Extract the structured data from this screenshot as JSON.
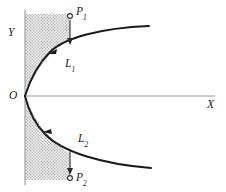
{
  "figure": {
    "kind": "geometry-diagram",
    "background_color": "#ffffff",
    "width": 226,
    "height": 192
  },
  "colors": {
    "axis": "#9a9a9a",
    "curve": "#1a1a1a",
    "drop_line": "#2a2a2a",
    "shade_fill": "#c9c9c9",
    "marker_fill": "#ffffff",
    "label_text": "#1a1a1a"
  },
  "axes": {
    "x_axis": {
      "name": "x-axis",
      "label": "X",
      "label_x": 211,
      "label_y": 105,
      "y_position": 96,
      "x_start": 25,
      "x_end": 215
    },
    "y_axis": {
      "name": "y-axis",
      "label": "Y",
      "label_x": 12,
      "label_y": 33,
      "x_position": 25,
      "y_start": 10,
      "y_end": 185
    },
    "origin": {
      "label": "O",
      "x": 25,
      "y": 96
    }
  },
  "shaded_region": {
    "name": "stippled-strip",
    "x": 25,
    "y": 14,
    "width": 45,
    "height": 166,
    "fill": "#c9c9c9",
    "pattern": "stipple",
    "note": "vertical strip to the right of the Y axis; interior of the parabola is left unshaded"
  },
  "curve": {
    "name": "parabola",
    "orientation": "opens-right",
    "vertex": {
      "x": 25,
      "y": 96
    },
    "upper_branch_end": {
      "x": 149,
      "y": 26
    },
    "lower_branch_end": {
      "x": 151,
      "y": 168
    },
    "direction_arrows": [
      {
        "x": 50,
        "y": 52,
        "points": "toward-vertex"
      },
      {
        "x": 45,
        "y": 131,
        "points": "toward-vertex"
      }
    ]
  },
  "points": [
    {
      "id": "P1",
      "label": "P",
      "subscript": "1",
      "marker_x": 70,
      "marker_y": 16,
      "label_x": 78,
      "label_y": 12,
      "marker": "open-circle"
    },
    {
      "id": "L1",
      "label": "L",
      "subscript": "1",
      "on_curve_x": 70,
      "on_curve_y": 45,
      "label_x": 67,
      "label_y": 64,
      "marker": "none"
    },
    {
      "id": "L2",
      "label": "L",
      "subscript": "2",
      "on_curve_x": 70,
      "on_curve_y": 149,
      "label_x": 80,
      "label_y": 139,
      "marker": "none"
    },
    {
      "id": "P2",
      "label": "P",
      "subscript": "2",
      "marker_x": 70,
      "marker_y": 178,
      "label_x": 78,
      "label_y": 178,
      "marker": "open-circle"
    }
  ],
  "projection_arrows": [
    {
      "name": "arrow-p1-to-l1",
      "from": {
        "x": 70,
        "y": 20
      },
      "to": {
        "x": 70,
        "y": 44
      },
      "direction": "down"
    },
    {
      "name": "arrow-l2-to-p2",
      "from": {
        "x": 70,
        "y": 150
      },
      "to": {
        "x": 70,
        "y": 174
      },
      "direction": "down"
    }
  ]
}
